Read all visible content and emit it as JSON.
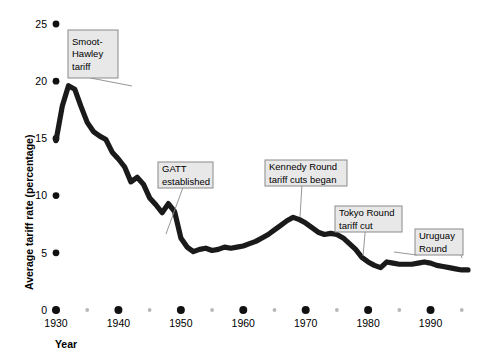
{
  "chart_data": {
    "type": "line",
    "title": "",
    "xlabel": "Year",
    "ylabel": "Average tariff rate (percentage)",
    "xlim": [
      1930,
      1996
    ],
    "ylim": [
      0,
      25
    ],
    "grid": false,
    "legend": "none",
    "x_tick_labels": [
      "1930",
      "1940",
      "1950",
      "1960",
      "1970",
      "1980",
      "1990"
    ],
    "x_tick_values": [
      1930,
      1940,
      1950,
      1960,
      1970,
      1980,
      1990
    ],
    "x_minor_tick_values": [
      1935,
      1945,
      1955,
      1965,
      1975,
      1985,
      1995
    ],
    "y_tick_labels": [
      "0",
      "5",
      "10",
      "15",
      "20",
      "25"
    ],
    "y_tick_values": [
      0,
      5,
      10,
      15,
      20,
      25
    ],
    "series": [
      {
        "name": "Average tariff rate",
        "x": [
          1930,
          1931,
          1932,
          1933,
          1934,
          1935,
          1936,
          1937,
          1938,
          1939,
          1940,
          1941,
          1942,
          1943,
          1944,
          1945,
          1946,
          1947,
          1948,
          1949,
          1950,
          1951,
          1952,
          1953,
          1954,
          1955,
          1956,
          1957,
          1958,
          1959,
          1960,
          1961,
          1962,
          1963,
          1964,
          1965,
          1966,
          1967,
          1968,
          1969,
          1970,
          1971,
          1972,
          1973,
          1974,
          1975,
          1976,
          1977,
          1978,
          1979,
          1980,
          1981,
          1982,
          1983,
          1984,
          1985,
          1986,
          1987,
          1988,
          1989,
          1990,
          1991,
          1992,
          1993,
          1994,
          1995,
          1996
        ],
        "values": [
          14.8,
          17.8,
          19.6,
          19.3,
          17.8,
          16.4,
          15.6,
          15.2,
          14.9,
          13.8,
          13.2,
          12.5,
          11.2,
          11.6,
          11.0,
          9.8,
          9.2,
          8.5,
          9.3,
          8.6,
          6.3,
          5.5,
          5.1,
          5.3,
          5.4,
          5.2,
          5.3,
          5.5,
          5.4,
          5.5,
          5.6,
          5.8,
          6.0,
          6.3,
          6.6,
          7.0,
          7.4,
          7.8,
          8.1,
          7.9,
          7.6,
          7.2,
          6.8,
          6.6,
          6.7,
          6.6,
          6.3,
          5.8,
          5.3,
          4.6,
          4.2,
          3.9,
          3.7,
          4.2,
          4.1,
          4.0,
          4.0,
          4.0,
          4.1,
          4.2,
          4.1,
          3.9,
          3.8,
          3.7,
          3.6,
          3.5,
          3.5
        ]
      }
    ],
    "annotations": [
      {
        "id": "smoot-hawley",
        "lines": [
          "Smoot-",
          "Hawley",
          "tariff"
        ],
        "box": {
          "x": 68,
          "y": 30,
          "width": 50,
          "height": 48
        },
        "target": {
          "x": 132,
          "y": 86
        }
      },
      {
        "id": "gatt-established",
        "lines": [
          "GATT",
          "established"
        ],
        "box": {
          "x": 158,
          "y": 162,
          "width": 55,
          "height": 26
        },
        "target": {
          "x": 166,
          "y": 234
        }
      },
      {
        "id": "kennedy-round",
        "lines": [
          "Kennedy Round",
          "tariff cuts began"
        ],
        "box": {
          "x": 265,
          "y": 160,
          "width": 82,
          "height": 26
        },
        "target": {
          "x": 300,
          "y": 217
        }
      },
      {
        "id": "tokyo-round",
        "lines": [
          "Tokyo Round",
          "tariff cut"
        ],
        "box": {
          "x": 335,
          "y": 206,
          "width": 67,
          "height": 26
        },
        "target": {
          "x": 363,
          "y": 256
        }
      },
      {
        "id": "uruguay-round",
        "lines": [
          "Uruguay",
          "Round"
        ],
        "box": {
          "x": 415,
          "y": 229,
          "width": 48,
          "height": 26
        },
        "target_left": {
          "x": 394,
          "y": 252
        },
        "target_right": {
          "x": 462,
          "y": 258
        }
      }
    ],
    "colors": {
      "line": "#1a1a1a",
      "callout_fill": "#e8e8e8",
      "callout_border": "#8a8a8a",
      "major_dot": "#111111",
      "minor_dot": "#b8b8b8",
      "background": "#ffffff"
    }
  }
}
